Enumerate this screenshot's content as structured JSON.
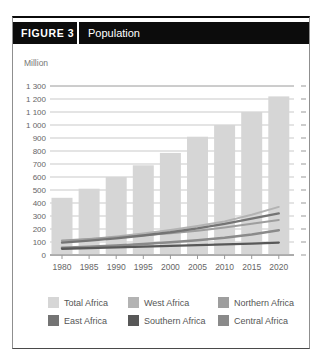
{
  "figure": {
    "label": "FIGURE 3",
    "title": "Population"
  },
  "chart_data": {
    "type": "bar+line",
    "unit_label": "Million",
    "categories": [
      "1980",
      "1985",
      "1990",
      "1995",
      "2000",
      "2005",
      "2010",
      "2015",
      "2020"
    ],
    "ylim": [
      0,
      1300
    ],
    "ytick_step": 100,
    "grid": true,
    "legend_position": "bottom",
    "bar_series": {
      "name": "Total Africa",
      "color": "#d6d6d6",
      "values": [
        440,
        510,
        600,
        690,
        785,
        910,
        1000,
        1100,
        1220
      ]
    },
    "line_series": [
      {
        "name": "West Africa",
        "color": "#b3b3b3",
        "width": 2,
        "values": [
          105,
          122,
          142,
          165,
          192,
          223,
          258,
          310,
          370
        ]
      },
      {
        "name": "Northern Africa",
        "color": "#9e9e9e",
        "width": 2,
        "values": [
          112,
          124,
          137,
          152,
          168,
          187,
          212,
          240,
          270
        ]
      },
      {
        "name": "Central Africa",
        "color": "#8a8a8a",
        "width": 2.5,
        "values": [
          55,
          63,
          73,
          85,
          98,
          113,
          132,
          158,
          190
        ]
      },
      {
        "name": "East Africa",
        "color": "#747474",
        "width": 2.3,
        "values": [
          95,
          110,
          128,
          150,
          175,
          205,
          240,
          280,
          320
        ]
      },
      {
        "name": "Southern Africa",
        "color": "#585858",
        "width": 2.3,
        "values": [
          48,
          53,
          58,
          64,
          70,
          76,
          82,
          88,
          95
        ]
      }
    ],
    "legend_order": [
      "Total Africa",
      "West Africa",
      "Northern Africa",
      "East Africa",
      "Southern Africa",
      "Central Africa"
    ]
  }
}
